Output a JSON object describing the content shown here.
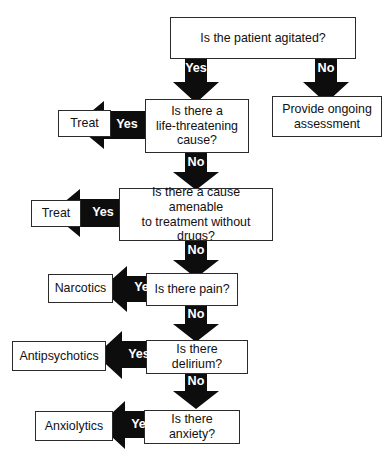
{
  "diagram": {
    "background_color": "#ffffff",
    "arrow_color": "#0d0d0d",
    "box_border_color": "#2b2b2b",
    "arrow_label_color": "#ffffff"
  },
  "nodes": {
    "agitated": "Is the patient agitated?",
    "life_threatening": "Is there a\nlife-threatening\ncause?",
    "treat_1": "Treat",
    "provide_ongoing": "Provide ongoing\nassessment",
    "amenable": "Is there a cause amenable\nto treatment without\ndrugs?",
    "treat_2": "Treat",
    "pain": "Is there pain?",
    "narcotics": "Narcotics",
    "delirium": "Is there delirium?",
    "antipsychotics": "Antipsychotics",
    "anxiety": "Is there anxiety?",
    "anxiolytics": "Anxiolytics"
  },
  "edges": {
    "agitated_yes": "Yes",
    "agitated_no": "No",
    "life_threatening_yes": "Yes",
    "life_threatening_no": "No",
    "amenable_yes": "Yes",
    "amenable_no": "No",
    "pain_yes": "Yes",
    "pain_no": "No",
    "delirium_yes": "Yes",
    "delirium_no": "No",
    "anxiety_yes": "Yes"
  }
}
